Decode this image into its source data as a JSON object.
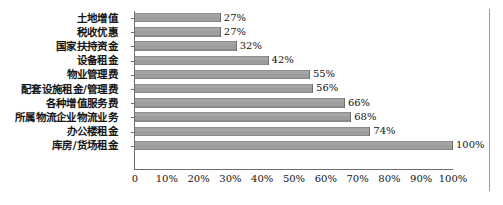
{
  "chart_data": {
    "type": "bar",
    "orientation": "horizontal",
    "title": "",
    "subtitle": "",
    "xlabel": "",
    "ylabel": "",
    "xlim": [
      0,
      100
    ],
    "grid": false,
    "legend": false,
    "value_suffix": "%",
    "categories": [
      "土地增值",
      "税收优惠",
      "国家扶持资金",
      "设备租金",
      "物业管理费",
      "配套设施租金/管理费",
      "各种增值服务费",
      "所属物流企业物流业务",
      "办公楼租金",
      "库房/货场租金"
    ],
    "values": [
      27,
      27,
      32,
      42,
      55,
      56,
      66,
      68,
      74,
      100
    ],
    "data_labels": [
      "27%",
      "27%",
      "32%",
      "42%",
      "55%",
      "56%",
      "66%",
      "68%",
      "74%",
      "100%"
    ],
    "xticks": [
      0,
      10,
      20,
      30,
      40,
      50,
      60,
      70,
      80,
      90,
      100
    ],
    "xtick_labels": [
      "0",
      "10%",
      "20%",
      "30%",
      "40%",
      "50%",
      "60%",
      "70%",
      "80%",
      "90%",
      "100%"
    ],
    "colors": {
      "bar_fill": "#a0a0a0",
      "bar_edge": "#7a7a7a",
      "axis": "#6d6d6d",
      "frame": "#9b9b9b",
      "text": "#141414",
      "background": "#ffffff"
    }
  }
}
